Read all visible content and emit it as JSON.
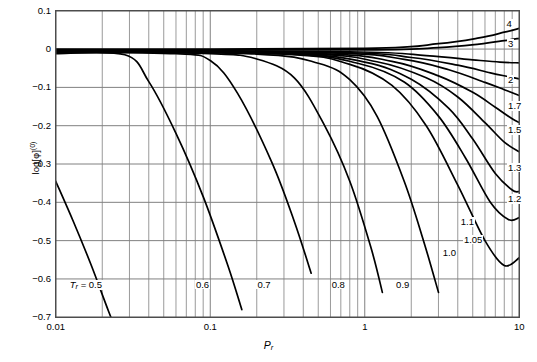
{
  "chart_data": {
    "type": "line",
    "title": "",
    "xlabel": "P_r",
    "ylabel": "log[φ]^(0)",
    "xscale": "log",
    "xlim": [
      0.01,
      10
    ],
    "ylim": [
      -0.7,
      0.1
    ],
    "grid": true,
    "legend_position": "inline-right-and-bottom",
    "xticks": [
      "0.01",
      "0.1",
      "1",
      "10"
    ],
    "yticks": [
      "0.1",
      "0",
      "−0.1",
      "−0.2",
      "−0.3",
      "−0.4",
      "−0.5",
      "−0.6",
      "−0.7"
    ],
    "series_label_prefix": "T_r",
    "series": [
      {
        "name": "0.5",
        "label": "T_r = 0.5",
        "label_pos": {
          "x": 0.0125,
          "y": -0.617
        },
        "x": [
          0.01,
          0.013,
          0.017,
          0.022,
          0.028
        ],
        "values": [
          -0.345,
          -0.45,
          -0.565,
          -0.685,
          -0.79
        ]
      },
      {
        "name": "0.6",
        "label": "0.6",
        "label_pos": {
          "x": 0.082,
          "y": -0.617
        },
        "x": [
          0.01,
          0.028,
          0.04,
          0.06,
          0.09,
          0.13,
          0.16
        ],
        "values": [
          -0.012,
          -0.015,
          -0.085,
          -0.22,
          -0.385,
          -0.565,
          -0.68
        ]
      },
      {
        "name": "0.7",
        "label": "0.7",
        "label_pos": {
          "x": 0.205,
          "y": -0.617
        },
        "x": [
          0.01,
          0.06,
          0.1,
          0.15,
          0.25,
          0.35,
          0.45
        ],
        "values": [
          -0.008,
          -0.012,
          -0.03,
          -0.115,
          -0.295,
          -0.45,
          -0.585
        ]
      },
      {
        "name": "0.8",
        "label": "0.8",
        "label_pos": {
          "x": 0.62,
          "y": -0.617
        },
        "x": [
          0.01,
          0.1,
          0.2,
          0.35,
          0.55,
          0.8,
          1.1,
          1.3
        ],
        "values": [
          -0.006,
          -0.012,
          -0.026,
          -0.075,
          -0.2,
          -0.345,
          -0.52,
          -0.635
        ]
      },
      {
        "name": "0.9",
        "label": "0.9",
        "label_pos": {
          "x": 1.62,
          "y": -0.617
        },
        "x": [
          0.01,
          0.2,
          0.5,
          0.8,
          1.2,
          1.8,
          2.4,
          3.0
        ],
        "values": [
          -0.005,
          -0.013,
          -0.037,
          -0.08,
          -0.175,
          -0.345,
          -0.5,
          -0.635
        ]
      },
      {
        "name": "1.0",
        "label": "1.0",
        "label_pos": {
          "x": 3.25,
          "y": -0.535
        },
        "x": [
          0.01,
          0.3,
          0.8,
          1.5,
          2.5,
          4.0,
          6.0,
          8.0,
          10.0
        ],
        "values": [
          -0.004,
          -0.013,
          -0.04,
          -0.095,
          -0.2,
          -0.355,
          -0.5,
          -0.565,
          -0.545
        ]
      },
      {
        "name": "1.05",
        "label": "1.05",
        "label_pos": {
          "x": 4.45,
          "y": -0.5
        },
        "x": [
          0.01,
          0.3,
          0.9,
          1.8,
          3.0,
          4.5,
          6.5,
          8.5,
          10.0
        ],
        "values": [
          -0.004,
          -0.012,
          -0.037,
          -0.086,
          -0.175,
          -0.285,
          -0.4,
          -0.445,
          -0.44
        ]
      },
      {
        "name": "1.1",
        "label": "1.1",
        "label_pos": {
          "x": 4.25,
          "y": -0.455
        },
        "x": [
          0.01,
          0.3,
          1.0,
          2.0,
          3.5,
          5.0,
          7.0,
          9.0,
          10.0
        ],
        "values": [
          -0.004,
          -0.011,
          -0.034,
          -0.079,
          -0.155,
          -0.235,
          -0.325,
          -0.368,
          -0.372
        ]
      },
      {
        "name": "1.2",
        "label": "1.2",
        "label_pos": {
          "x": 8.6,
          "y": -0.395
        },
        "x": [
          0.01,
          0.4,
          1.2,
          2.5,
          4.0,
          6.0,
          8.0,
          10.0
        ],
        "values": [
          -0.003,
          -0.012,
          -0.033,
          -0.075,
          -0.125,
          -0.192,
          -0.243,
          -0.268
        ]
      },
      {
        "name": "1.3",
        "label": "1.3",
        "label_pos": {
          "x": 8.6,
          "y": -0.312
        },
        "x": [
          0.01,
          0.5,
          1.5,
          3.0,
          5.0,
          7.0,
          9.0,
          10.0
        ],
        "values": [
          -0.003,
          -0.012,
          -0.032,
          -0.07,
          -0.113,
          -0.152,
          -0.182,
          -0.192
        ]
      },
      {
        "name": "1.5",
        "label": "1.5",
        "label_pos": {
          "x": 8.6,
          "y": -0.215
        },
        "x": [
          0.01,
          0.6,
          1.8,
          3.5,
          6.0,
          8.0,
          10.0
        ],
        "values": [
          -0.002,
          -0.01,
          -0.027,
          -0.054,
          -0.087,
          -0.106,
          -0.121
        ]
      },
      {
        "name": "1.7",
        "label": "1.7",
        "label_pos": {
          "x": 8.6,
          "y": -0.152
        },
        "x": [
          0.01,
          0.7,
          2.0,
          4.0,
          6.5,
          8.5,
          10.0
        ],
        "values": [
          -0.002,
          -0.009,
          -0.022,
          -0.042,
          -0.062,
          -0.072,
          -0.078
        ]
      },
      {
        "name": "2",
        "label": "2",
        "label_pos": {
          "x": 8.6,
          "y": -0.082
        },
        "x": [
          0.01,
          0.8,
          2.5,
          5.0,
          7.5,
          10.0
        ],
        "values": [
          -0.002,
          -0.007,
          -0.017,
          -0.028,
          -0.034,
          -0.036
        ]
      },
      {
        "name": "3",
        "label": "3",
        "label_pos": {
          "x": 8.6,
          "y": 0.012
        },
        "x": [
          0.01,
          1.0,
          3.0,
          5.5,
          8.0,
          10.0
        ],
        "values": [
          -0.001,
          -0.002,
          0.004,
          0.013,
          0.022,
          0.028
        ]
      },
      {
        "name": "4",
        "label": "4",
        "label_pos": {
          "x": 8.4,
          "y": 0.062
        },
        "x": [
          0.01,
          1.0,
          3.0,
          5.5,
          8.0,
          10.0
        ],
        "values": [
          -0.001,
          0.002,
          0.014,
          0.029,
          0.044,
          0.054
        ]
      }
    ]
  },
  "colors": {
    "curve": "#000000",
    "grid": "#808080",
    "axis": "#4d4d4d",
    "background": "#ffffff",
    "text": "#000000"
  }
}
